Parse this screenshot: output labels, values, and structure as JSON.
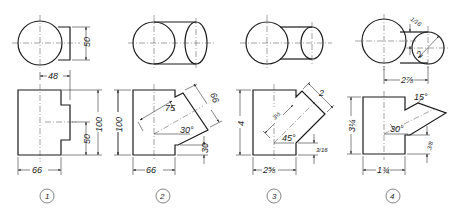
{
  "figures": [
    {
      "label": "1",
      "dims": {
        "top_height": "50",
        "offset": "48",
        "width": "66",
        "branch_height": "50",
        "height_inner": "100",
        "height_outer": "100"
      }
    },
    {
      "label": "2",
      "dims": {
        "height": "100",
        "branch_length": "75",
        "branch_diameter": "66",
        "angle": "30°",
        "offset_bottom": "30",
        "width": "66"
      }
    },
    {
      "label": "3",
      "dims": {
        "height": "4",
        "branch_length": "3½",
        "branch_diameter": "2",
        "angle": "45°",
        "offset_bottom": "3/16",
        "width": "2⅝"
      }
    },
    {
      "label": "4",
      "dims": {
        "top_gap": "1/16",
        "small_diameter": "2",
        "center_distance": "2⅞",
        "tip_angle": "15°",
        "angle": "30°",
        "height": "3¼",
        "offset_bottom": "3/8",
        "width": "1¾"
      }
    }
  ]
}
